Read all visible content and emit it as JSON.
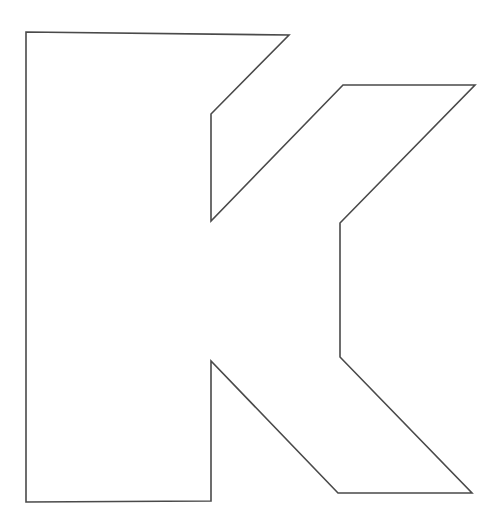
{
  "page": {
    "background_color": "#ffffff",
    "width": 500,
    "height": 526
  },
  "artwork": {
    "name": "letter-k-outline",
    "description": "Outline drawing of the capital letter K",
    "character": "K",
    "stroke_color": "#4a4a4a",
    "fill_color": "#ffffff",
    "stroke_width": 1.6,
    "points": "26,32 289,35 211,114 211,221 343,85 475,85 340,223 340,357 472,493 338,493 211,361 211,501 26,502",
    "vertices": [
      {
        "label": "top-left-corner",
        "x": 26,
        "y": 32
      },
      {
        "label": "top-right-apex",
        "x": 289,
        "y": 35
      },
      {
        "label": "upper-notch-outer",
        "x": 211,
        "y": 114
      },
      {
        "label": "upper-notch-lower",
        "x": 211,
        "y": 221
      },
      {
        "label": "upper-arm-inner-top",
        "x": 343,
        "y": 85
      },
      {
        "label": "upper-arm-tip",
        "x": 475,
        "y": 85
      },
      {
        "label": "mid-junction-top",
        "x": 340,
        "y": 223
      },
      {
        "label": "mid-junction-bottom",
        "x": 340,
        "y": 357
      },
      {
        "label": "lower-arm-tip",
        "x": 472,
        "y": 493
      },
      {
        "label": "lower-arm-inner-bottom",
        "x": 338,
        "y": 493
      },
      {
        "label": "lower-notch-apex",
        "x": 211,
        "y": 361
      },
      {
        "label": "stem-bottom-right",
        "x": 211,
        "y": 501
      },
      {
        "label": "stem-bottom-left",
        "x": 26,
        "y": 502
      }
    ]
  }
}
